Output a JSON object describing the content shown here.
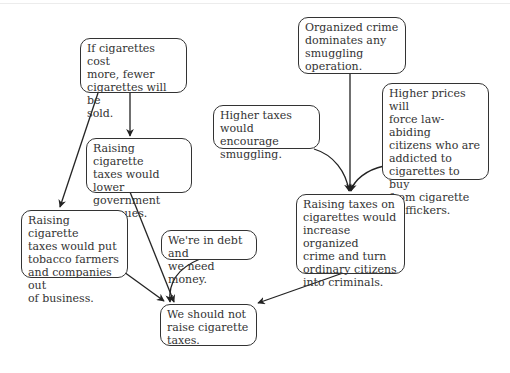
{
  "diagram": {
    "type": "argument-map",
    "nodes": [
      {
        "id": "A",
        "text": "If cigarettes cost\nmore, fewer\ncigarettes will be\nsold."
      },
      {
        "id": "B",
        "text": "Raising cigarette\ntaxes would lower\ngovernment\nrevenues."
      },
      {
        "id": "C",
        "text": "Raising cigarette\ntaxes would put\ntobacco farmers\nand companies out\nof business."
      },
      {
        "id": "D",
        "text": "We're in debt and\nwe need money."
      },
      {
        "id": "E",
        "text": "We should not\nraise cigarette\ntaxes."
      },
      {
        "id": "F",
        "text": "Organized crime\ndominates any\nsmuggling\noperation."
      },
      {
        "id": "G",
        "text": "Higher taxes would\nencourage\nsmuggling."
      },
      {
        "id": "H",
        "text": "Higher prices will\nforce law-abiding\ncitizens who are\naddicted to\ncigarettes to buy\nfrom cigarette\ntraffickers."
      },
      {
        "id": "I",
        "text": "Raising taxes on\ncigarettes would\nincrease organized\ncrime and turn\nordinary citizens\ninto criminals."
      }
    ],
    "edges": [
      {
        "from": "A",
        "to": "B"
      },
      {
        "from": "A",
        "to": "C"
      },
      {
        "from": "B",
        "to": "E"
      },
      {
        "from": "C",
        "to": "E"
      },
      {
        "from": "D",
        "to": "E"
      },
      {
        "from": "F",
        "to": "I"
      },
      {
        "from": "G",
        "to": "I"
      },
      {
        "from": "H",
        "to": "I"
      },
      {
        "from": "I",
        "to": "E"
      }
    ]
  }
}
